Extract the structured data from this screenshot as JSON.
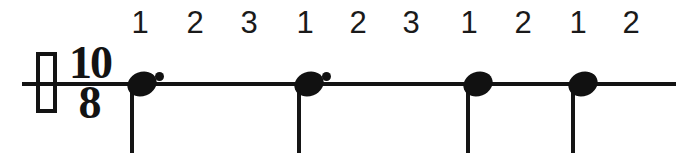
{
  "figure": {
    "kind": "music-notation-rhythm-diagram",
    "background_color": "#ffffff",
    "ink_color": "#131313",
    "width": 678,
    "height": 155
  },
  "staff": {
    "line_y": 82,
    "line_x_start": 22,
    "line_x_end": 676
  },
  "clef_box": {
    "label": "hollow-rectangle",
    "x": 36,
    "y": 52,
    "width": 21,
    "height": 61
  },
  "time_signature": {
    "numerator": "10",
    "denominator": "8",
    "display": "10/8",
    "x": 62,
    "y": 42
  },
  "counts": [
    {
      "label": "1",
      "x": 140,
      "beat_group": 1,
      "accented": true
    },
    {
      "label": "2",
      "x": 195,
      "beat_group": 1,
      "accented": false
    },
    {
      "label": "3",
      "x": 249,
      "beat_group": 1,
      "accented": false
    },
    {
      "label": "1",
      "x": 305,
      "beat_group": 2,
      "accented": true
    },
    {
      "label": "2",
      "x": 358,
      "beat_group": 2,
      "accented": false
    },
    {
      "label": "3",
      "x": 411,
      "beat_group": 2,
      "accented": false
    },
    {
      "label": "1",
      "x": 469,
      "beat_group": 3,
      "accented": true
    },
    {
      "label": "2",
      "x": 523,
      "beat_group": 3,
      "accented": false
    },
    {
      "label": "1",
      "x": 578,
      "beat_group": 4,
      "accented": true
    },
    {
      "label": "2",
      "x": 631,
      "beat_group": 4,
      "accented": false
    }
  ],
  "notes": [
    {
      "name": "dotted-quarter-note-1",
      "head_x": 142,
      "head_y": 84,
      "dotted": true,
      "dot_x": 159,
      "dot_y": 76,
      "stem_x": 130,
      "stem_top": 84,
      "stem_bottom": 153,
      "duration_eighths": 3,
      "duration_label": "dotted quarter"
    },
    {
      "name": "dotted-quarter-note-2",
      "head_x": 309,
      "head_y": 84,
      "dotted": true,
      "dot_x": 326,
      "dot_y": 76,
      "stem_x": 297,
      "stem_top": 84,
      "stem_bottom": 153,
      "duration_eighths": 3,
      "duration_label": "dotted quarter"
    },
    {
      "name": "quarter-note-3",
      "head_x": 478,
      "head_y": 84,
      "dotted": false,
      "stem_x": 466,
      "stem_top": 84,
      "stem_bottom": 153,
      "duration_eighths": 2,
      "duration_label": "quarter"
    },
    {
      "name": "quarter-note-4",
      "head_x": 583,
      "head_y": 84,
      "dotted": false,
      "stem_x": 571,
      "stem_top": 84,
      "stem_bottom": 153,
      "duration_eighths": 2,
      "duration_label": "quarter"
    }
  ]
}
